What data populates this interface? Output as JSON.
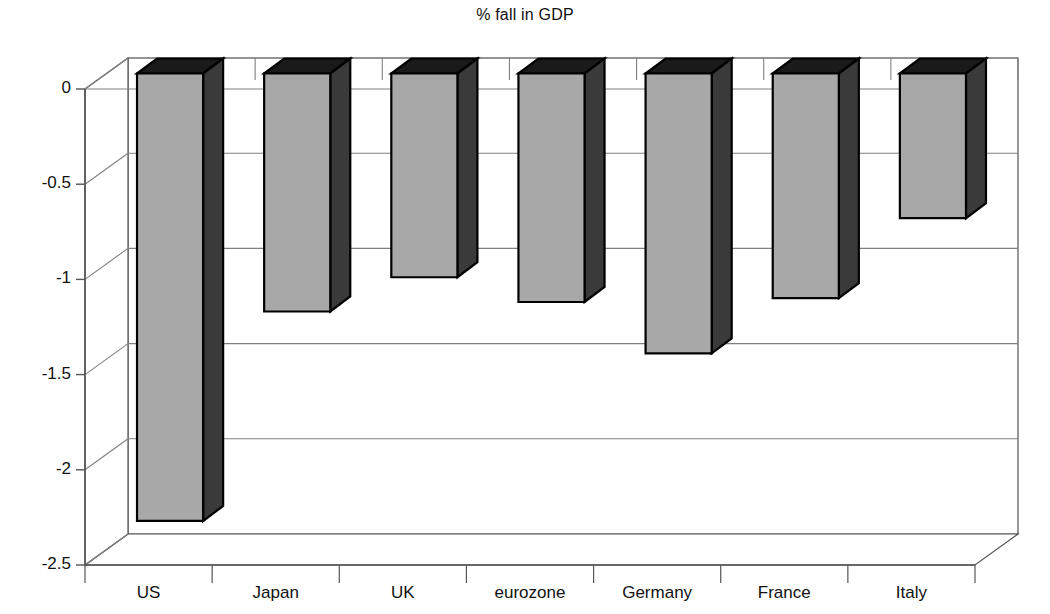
{
  "chart_data": {
    "type": "bar",
    "title": "% fall in GDP",
    "xlabel": "",
    "ylabel": "",
    "categories": [
      "US",
      "Japan",
      "UK",
      "eurozone",
      "Germany",
      "France",
      "Italy"
    ],
    "values": [
      -2.35,
      -1.25,
      -1.07,
      -1.2,
      -1.47,
      -1.18,
      -0.76
    ],
    "ylim": [
      -2.5,
      0
    ],
    "ytick_labels": [
      "0",
      "-0.5",
      "-1",
      "-1.5",
      "-2",
      "-2.5"
    ],
    "ytick_values": [
      0,
      -0.5,
      -1,
      -1.5,
      -2,
      -2.5
    ],
    "grid": true,
    "legend": "none",
    "style": "3d-column",
    "colors": {
      "bar_front": "#a8a8a8",
      "bar_side": "#3a3a3a",
      "bar_top": "#1a1a1a",
      "bar_outline": "#000000",
      "gridline": "#808080",
      "axis": "#555555",
      "background": "#ffffff",
      "text": "#111111"
    }
  }
}
